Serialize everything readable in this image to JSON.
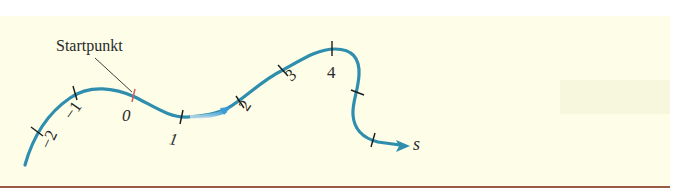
{
  "figure": {
    "start_label": "Startpunkt",
    "axis_variable": "s",
    "ticks": [
      {
        "label": "−2",
        "italic": false
      },
      {
        "label": "−1",
        "italic": false
      },
      {
        "label": "0",
        "italic": true
      },
      {
        "label": "1",
        "italic": true
      },
      {
        "label": "2",
        "italic": false
      },
      {
        "label": "3",
        "italic": false
      },
      {
        "label": "4",
        "italic": false
      }
    ],
    "colors": {
      "curve": "#2f8eae",
      "start_tick": "#d0605a",
      "tick": "#1a1a1a",
      "background": "#fdfde8",
      "rule": "#9a5a46",
      "direction_arrow_start": "#ffffff",
      "direction_arrow_end": "#3a9bd5"
    }
  }
}
